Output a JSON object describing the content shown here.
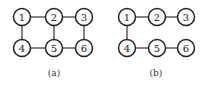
{
  "diagrams": [
    {
      "id": "a",
      "caption": "(a)",
      "nodes": [
        {
          "label": "1",
          "x": 22,
          "y": 17
        },
        {
          "label": "2",
          "x": 54,
          "y": 17
        },
        {
          "label": "3",
          "x": 84,
          "y": 17
        },
        {
          "label": "4",
          "x": 22,
          "y": 48
        },
        {
          "label": "5",
          "x": 54,
          "y": 48
        },
        {
          "label": "6",
          "x": 84,
          "y": 48
        }
      ],
      "edges": [
        [
          "1",
          "2"
        ],
        [
          "2",
          "3"
        ],
        [
          "1",
          "4"
        ],
        [
          "2",
          "5"
        ],
        [
          "3",
          "6"
        ],
        [
          "4",
          "5"
        ],
        [
          "5",
          "6"
        ]
      ],
      "caption_pos": {
        "x": 54,
        "y": 76
      }
    },
    {
      "id": "b",
      "caption": "(b)",
      "nodes": [
        {
          "label": "1",
          "x": 127,
          "y": 17
        },
        {
          "label": "2",
          "x": 157,
          "y": 17
        },
        {
          "label": "3",
          "x": 186,
          "y": 17
        },
        {
          "label": "4",
          "x": 127,
          "y": 48
        },
        {
          "label": "5",
          "x": 157,
          "y": 48
        },
        {
          "label": "6",
          "x": 186,
          "y": 48
        }
      ],
      "edges": [
        [
          "1",
          "2"
        ],
        [
          "2",
          "3"
        ],
        [
          "1",
          "4"
        ],
        [
          "4",
          "5"
        ],
        [
          "5",
          "6"
        ]
      ],
      "caption_pos": {
        "x": 156,
        "y": 76
      }
    }
  ],
  "style": {
    "node_radius": 8.5
  }
}
